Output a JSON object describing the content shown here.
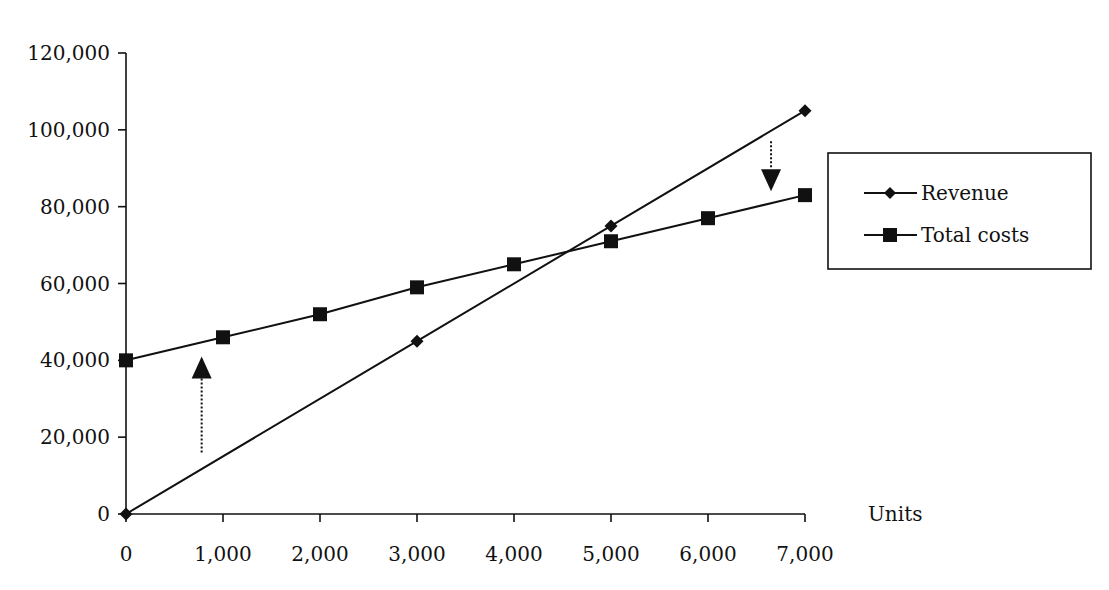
{
  "chart_data": {
    "type": "line",
    "title": "",
    "xlabel": "Units",
    "ylabel": "",
    "x": [
      0,
      1000,
      2000,
      3000,
      4000,
      5000,
      6000,
      7000
    ],
    "x_tick_labels": [
      "0",
      "1,000",
      "2,000",
      "3,000",
      "4,000",
      "5,000",
      "6,000",
      "7,000"
    ],
    "y_ticks": [
      0,
      20000,
      40000,
      60000,
      80000,
      100000,
      120000
    ],
    "y_tick_labels": [
      "0",
      "20,000",
      "40,000",
      "60,000",
      "80,000",
      "100,000",
      "120,000"
    ],
    "xlim": [
      0,
      7000
    ],
    "ylim": [
      0,
      120000
    ],
    "grid": false,
    "legend_position": "right",
    "series": [
      {
        "name": "Revenue",
        "marker": "diamond",
        "x": [
          0,
          3000,
          5000,
          7000
        ],
        "values": [
          0,
          45000,
          75000,
          105000
        ],
        "color": "#111111"
      },
      {
        "name": "Total costs",
        "marker": "square",
        "x": [
          0,
          1000,
          2000,
          3000,
          4000,
          5000,
          6000,
          7000
        ],
        "values": [
          40000,
          46000,
          52000,
          59000,
          65000,
          71000,
          77000,
          83000
        ],
        "color": "#111111"
      }
    ],
    "annotations": [
      {
        "type": "dotted-arrow",
        "direction": "up",
        "x": 780,
        "y_from": 16000,
        "y_to": 41000
      },
      {
        "type": "dotted-arrow",
        "direction": "down",
        "x": 6650,
        "y_from": 97000,
        "y_to": 84000
      }
    ]
  }
}
